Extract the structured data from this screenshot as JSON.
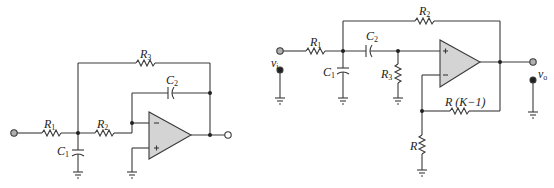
{
  "figure": {
    "left_circuit": {
      "description": "Multiple-feedback low-pass active filter (inverting op-amp)",
      "components": {
        "R1": {
          "label": "R",
          "sub": "1"
        },
        "R2": {
          "label": "R",
          "sub": "2"
        },
        "R3": {
          "label": "R",
          "sub": "3"
        },
        "C1": {
          "label": "C",
          "sub": "1"
        },
        "C2": {
          "label": "C",
          "sub": "2"
        }
      },
      "opamp": {
        "minus": "−",
        "plus": "+"
      }
    },
    "right_circuit": {
      "description": "Sallen-Key high-pass active filter with gain K",
      "components": {
        "R1": {
          "label": "R",
          "sub": "1"
        },
        "R2": {
          "label": "R",
          "sub": "2"
        },
        "R3": {
          "label": "R",
          "sub": "3"
        },
        "C1": {
          "label": "C",
          "sub": "1"
        },
        "C2": {
          "label": "C",
          "sub": "2"
        },
        "RK": {
          "label": "R (K−1)"
        },
        "R": {
          "label": "R"
        }
      },
      "vi": {
        "label": "v",
        "sub": "i"
      },
      "vo": {
        "label": "v",
        "sub": "o"
      },
      "opamp": {
        "minus": "−",
        "plus": "+"
      }
    },
    "colors": {
      "wire": "#3a3a3a",
      "opamp_fill": "#d4d4d4",
      "terminal_fill": "#b0b0b0"
    }
  }
}
